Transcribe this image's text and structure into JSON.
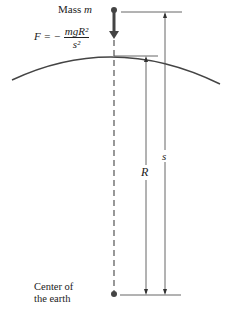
{
  "diagram": {
    "mass_label": "Mass",
    "mass_var": "m",
    "force": {
      "lhs": "F = −",
      "numerator": "mgR²",
      "denominator": "s²"
    },
    "radius_label": "R",
    "distance_label": "s",
    "center_label_line1": "Center of",
    "center_label_line2": "the earth",
    "colors": {
      "ink": "#333333",
      "background": "#ffffff"
    }
  }
}
